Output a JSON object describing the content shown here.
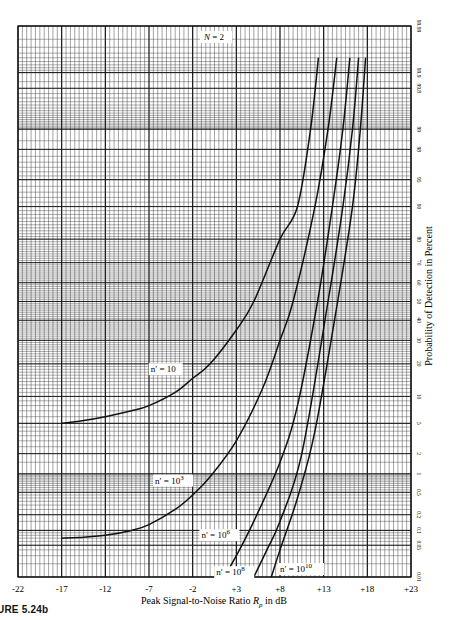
{
  "figure": {
    "caption": "URE 5.24b",
    "annotation_top": "N = 2"
  },
  "chart_data": {
    "type": "line",
    "title": "",
    "xlabel": "Peak Signal-to-Noise Ratio R_p in dB",
    "xlabel_main": "Peak Signal-to-Noise Ratio ",
    "xlabel_var": "R",
    "xlabel_sub": "p",
    "xlabel_tail": " in dB",
    "ylabel": "Probability of Detection in Percent",
    "xlim": [
      -22,
      23
    ],
    "ylim": [
      0.01,
      99.99
    ],
    "y_scale": "normal-probability",
    "grid": true,
    "x_ticks": [
      -22,
      -17,
      -12,
      -7,
      -2,
      3,
      8,
      13,
      18,
      23
    ],
    "x_tick_labels": [
      "-22",
      "-17",
      "-12",
      "-7",
      "-2",
      "+3",
      "+8",
      "+13",
      "+18",
      "+23"
    ],
    "y_ticks": [
      0.01,
      0.05,
      0.1,
      0.2,
      0.5,
      1,
      2,
      5,
      10,
      20,
      30,
      40,
      50,
      60,
      70,
      80,
      90,
      95,
      98,
      99,
      99.8,
      99.9,
      99.99
    ],
    "y_tick_labels": [
      "0.01",
      "0.05",
      "0.1",
      "0.2",
      "0.5",
      "1",
      "2",
      "5",
      "10",
      "20",
      "30",
      "40",
      "50",
      "60",
      "70",
      "80",
      "90",
      "95",
      "98",
      "99",
      "99.8",
      "99.9",
      "99.99"
    ],
    "annotations": [
      "N = 2"
    ],
    "series": [
      {
        "name": "n' = 10",
        "label_base": "n′ = 10",
        "label_exp": "",
        "label_pos": [
          -6.8,
          17
        ],
        "x": [
          -17,
          -15,
          -12,
          -9,
          -7,
          -4,
          -2,
          0,
          3,
          5,
          8,
          10,
          11.5,
          12.4
        ],
        "y": [
          5,
          5.3,
          6,
          7,
          8,
          11,
          15,
          20,
          35,
          50,
          80,
          90,
          99,
          99.95
        ]
      },
      {
        "name": "n' = 10^3",
        "label_base": "n′ = 10",
        "label_exp": "3",
        "label_pos": [
          -6.3,
          0.7
        ],
        "x": [
          -17,
          -15,
          -12,
          -9,
          -7,
          -4,
          -2,
          0,
          3,
          6,
          8,
          9.5,
          12,
          13.5,
          14.5
        ],
        "y": [
          0.07,
          0.072,
          0.08,
          0.1,
          0.13,
          0.25,
          0.45,
          0.9,
          3,
          12,
          30,
          50,
          90,
          99,
          99.95
        ]
      },
      {
        "name": "n' = 10^6",
        "label_base": "n′ = 10",
        "label_exp": "6",
        "label_pos": [
          -1,
          0.07
        ],
        "x": [
          1.6,
          3,
          5,
          8,
          10,
          12.3,
          14,
          15.2,
          16
        ],
        "y": [
          0.01,
          0.03,
          0.15,
          1.5,
          8,
          50,
          90,
          99,
          99.95
        ]
      },
      {
        "name": "n' = 10^8",
        "label_base": "n′ = 10",
        "label_exp": "8",
        "label_pos": [
          0.7,
          0.011
        ],
        "x": [
          5,
          6.5,
          8,
          10.5,
          13.5,
          15.2,
          16.3,
          17
        ],
        "y": [
          0.01,
          0.04,
          0.15,
          2,
          50,
          90,
          99,
          99.95
        ]
      },
      {
        "name": "n' = 10^10",
        "label_base": "n′ = 10",
        "label_exp": "10",
        "label_pos": [
          8,
          0.013
        ],
        "x": [
          7,
          8,
          10,
          12,
          14.6,
          16.3,
          17.2,
          17.8
        ],
        "y": [
          0.01,
          0.04,
          0.4,
          4,
          50,
          90,
          99,
          99.95
        ]
      }
    ],
    "styles": {
      "line_color": "#111111",
      "grid_color": "#333333",
      "background": "#ffffff"
    }
  }
}
